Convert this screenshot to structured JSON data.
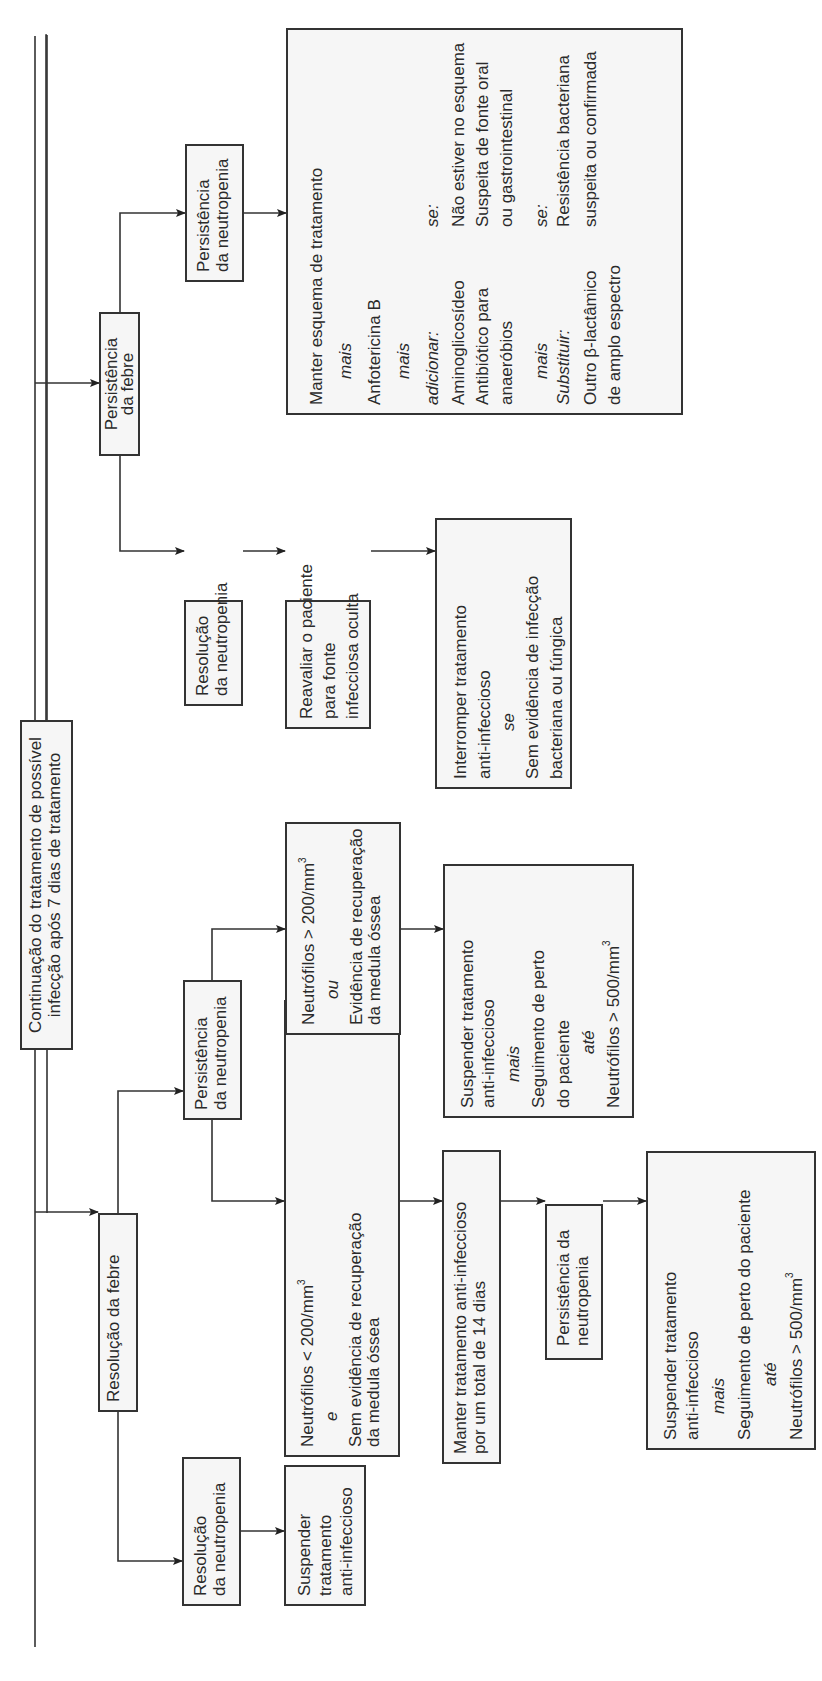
{
  "diagram": {
    "title": "Continuação do tratamento de possível infecção após 7 dias de tratamento",
    "nodes": {
      "root": {
        "lines": [
          "Continuação do tratamento de possível",
          "infecção após 7 dias de tratamento"
        ]
      },
      "res_febre": {
        "lines": [
          "Resolução da febre"
        ]
      },
      "pers_febre": {
        "lines": [
          "Persistência",
          "da febre"
        ]
      },
      "res_neutro_a": {
        "lines": [
          "Resolução",
          "da neutropenia"
        ]
      },
      "suspender_a": {
        "lines": [
          "Suspender",
          "tratamento",
          "anti-infeccioso"
        ]
      },
      "pers_neutro_a": {
        "lines": [
          "Persistência",
          "da neutropenia"
        ]
      },
      "neut_lt200": {
        "lines": [
          "Neutrófilos < 200/mm",
          "e",
          "Sem evidência de recuperação",
          "da medula óssea"
        ],
        "sup": "3",
        "connector": "e"
      },
      "neut_gt200": {
        "lines": [
          "Neutrófilos > 200/mm",
          "ou",
          "Evidência de recuperação",
          "da medula óssea"
        ],
        "sup": "3",
        "connector": "ou"
      },
      "manter14": {
        "lines": [
          "Manter tratamento anti-infeccioso",
          "por um total de 14 dias"
        ]
      },
      "pers_neutro_b": {
        "lines": [
          "Persistência da",
          "neutropenia"
        ]
      },
      "suspender_b": {
        "lines": [
          "Suspender tratamento",
          "anti-infeccioso",
          "mais",
          "Seguimento de perto do paciente",
          "até",
          "Neutrófilos > 500/mm"
        ],
        "sup": "3"
      },
      "suspender_c": {
        "lines": [
          "Suspender tratamento",
          "anti-infeccioso",
          "mais",
          "Seguimento de perto",
          "do paciente",
          "até",
          "Neutrófilos > 500/mm"
        ],
        "sup": "3"
      },
      "res_neutro_b": {
        "lines": [
          "Resolução",
          "da neutropenia"
        ]
      },
      "reavaliar": {
        "lines": [
          "Reavaliar o paciente",
          "para fonte",
          "infecciosa oculta"
        ]
      },
      "interromper": {
        "lines": [
          "Interromper tratamento",
          "anti-infeccioso",
          "se",
          "Sem evidência de infecção",
          "bacteriana ou fúngica"
        ]
      },
      "pers_neutro_c": {
        "lines": [
          "Persistência",
          "da neutropenia"
        ]
      },
      "manter_esquema": {
        "lines": [
          "Manter esquema de tratamento",
          "mais",
          "Anfotericina B",
          "mais"
        ],
        "adicionar": {
          "label": "adicionar:",
          "cond_label": "se:",
          "items": [
            "Aminoglicosídeo",
            "Antibiótico para",
            "anaeróbios"
          ],
          "conds": [
            "Não estiver no esquema",
            "Suspeita de fonte oral",
            "ou gastrointestinal"
          ]
        },
        "mais2": "mais",
        "substituir": {
          "label": "Substituir:",
          "cond_label": "se:",
          "items": [
            "Outro β-lactâmico",
            "de amplo espectro"
          ],
          "conds": [
            "Resistência bacteriana",
            "suspeita ou confirmada"
          ]
        }
      }
    }
  }
}
